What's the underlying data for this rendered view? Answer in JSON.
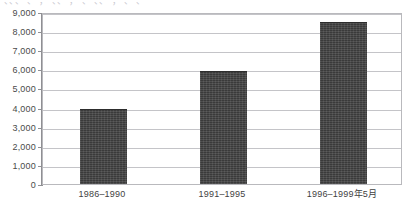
{
  "figure": {
    "clipped_title_remnant": "、、、 、 ， 、、 ， 、 、、 ， 、 、"
  },
  "chart_data": {
    "type": "bar",
    "title": "",
    "subtitle": "",
    "xlabel": "",
    "ylabel": "",
    "categories": [
      "1986–1990",
      "1991–1995",
      "1996–1999年5月"
    ],
    "values": [
      4000,
      5950,
      8550
    ],
    "ylim": [
      0,
      9000
    ],
    "ytick_values": [
      0,
      1000,
      2000,
      3000,
      4000,
      5000,
      6000,
      7000,
      8000,
      9000
    ],
    "ytick_labels": [
      "0",
      "1,000",
      "2,000",
      "3,000",
      "4,000",
      "5,000",
      "6,000",
      "7,000",
      "8,000",
      "9,000"
    ],
    "grid": true,
    "grid_axis": "y",
    "legend": false,
    "legend_position": "none",
    "bar_color": "#3a3a3a",
    "gridline_color": "#c4c4c8",
    "axis_color": "#8f8f93",
    "frame_color": "#b9b9bd",
    "background_color": "#ffffff",
    "text_color": "#3f3f3f"
  }
}
